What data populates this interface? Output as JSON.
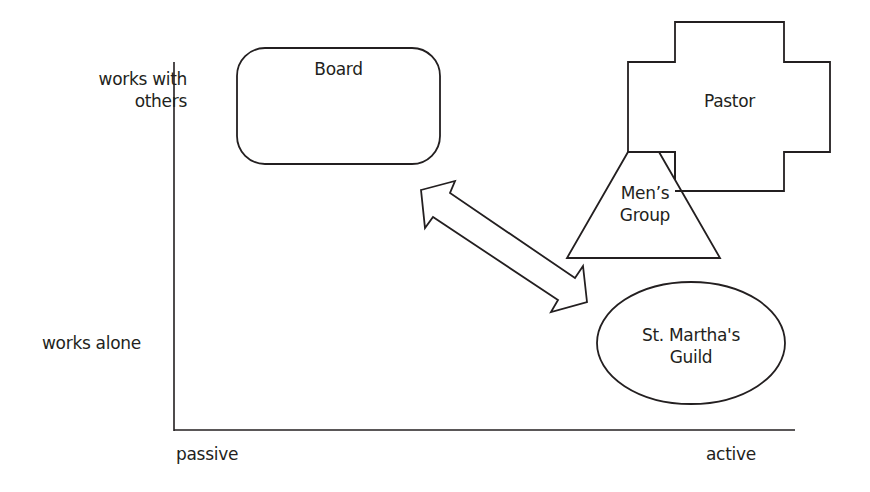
{
  "diagram": {
    "type": "2d-positioning-map",
    "axes": {
      "y_top_label": "works with\nothers",
      "y_top_label_line1": "works with",
      "y_top_label_line2": "others",
      "y_bottom_label": "works alone",
      "x_left_label": "passive",
      "x_right_label": "active"
    },
    "nodes": [
      {
        "id": "board",
        "shape": "rounded-rectangle",
        "label": "Board"
      },
      {
        "id": "pastor",
        "shape": "cross",
        "label": "Pastor"
      },
      {
        "id": "mens-group",
        "shape": "trapezoid",
        "label_line1": "Men’s",
        "label_line2": "Group"
      },
      {
        "id": "st-marthas-guild",
        "shape": "ellipse",
        "label_line1": "St. Martha's",
        "label_line2": "Guild"
      }
    ],
    "connectors": [
      {
        "from": "board",
        "to": "st-marthas-guild",
        "type": "double-headed-arrow"
      }
    ],
    "colors": {
      "stroke": "#231f20",
      "fill": "#ffffff",
      "text": "#231f20"
    }
  }
}
